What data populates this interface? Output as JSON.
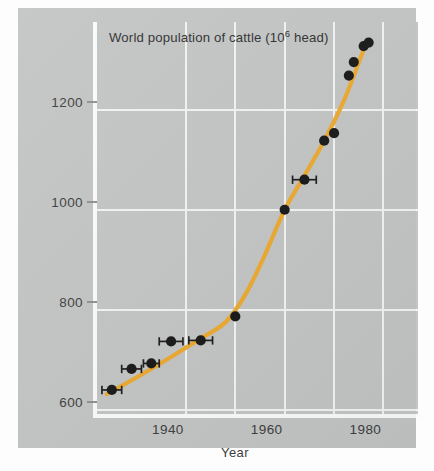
{
  "chart_data": {
    "type": "scatter",
    "title_main": "World population of cattle (10",
    "title_exp": "6",
    "title_tail": " head)",
    "xlabel": "Year",
    "ylabel": "",
    "xlim": [
      1922,
      1987
    ],
    "ylim": [
      592,
      1375
    ],
    "grid": true,
    "legend": null,
    "accent_color": "#eca92f",
    "point_color": "#171717",
    "background_color": "#c3c5c5",
    "gridline_color": "#f2f3f3",
    "yticks": [
      600,
      800,
      1000,
      1200
    ],
    "ytick_labels": [
      "600",
      "800",
      "1000",
      "1200"
    ],
    "xticks": [
      1940,
      1960,
      1980
    ],
    "xtick_labels": [
      "1940",
      "1960",
      "1980"
    ],
    "xgridlines": [
      1940,
      1950,
      1960,
      1970,
      1980
    ],
    "series": [
      {
        "name": "Observed cattle population",
        "marker": "filled-circle",
        "points": [
          {
            "x": 1925,
            "y": 640,
            "xerr": 2.0
          },
          {
            "x": 1929,
            "y": 682,
            "xerr": 2.0
          },
          {
            "x": 1933,
            "y": 693,
            "xerr": 1.6
          },
          {
            "x": 1937,
            "y": 737,
            "xerr": 2.4
          },
          {
            "x": 1943,
            "y": 739,
            "xerr": 2.4
          },
          {
            "x": 1950,
            "y": 787,
            "xerr": 0
          },
          {
            "x": 1960,
            "y": 1000,
            "xerr": 0
          },
          {
            "x": 1964,
            "y": 1060,
            "xerr": 2.4
          },
          {
            "x": 1968,
            "y": 1138,
            "xerr": 0
          },
          {
            "x": 1970,
            "y": 1153,
            "xerr": 0
          },
          {
            "x": 1973,
            "y": 1268,
            "xerr": 0
          },
          {
            "x": 1974,
            "y": 1295,
            "xerr": 0
          },
          {
            "x": 1976,
            "y": 1327,
            "xerr": 0
          },
          {
            "x": 1977,
            "y": 1334,
            "xerr": 0
          }
        ]
      },
      {
        "name": "Fitted trend curve",
        "marker": "line",
        "points": [
          {
            "x": 1924,
            "y": 632
          },
          {
            "x": 1930,
            "y": 665
          },
          {
            "x": 1936,
            "y": 700
          },
          {
            "x": 1942,
            "y": 737
          },
          {
            "x": 1948,
            "y": 775
          },
          {
            "x": 1952,
            "y": 830
          },
          {
            "x": 1956,
            "y": 910
          },
          {
            "x": 1960,
            "y": 1000
          },
          {
            "x": 1964,
            "y": 1068
          },
          {
            "x": 1968,
            "y": 1138
          },
          {
            "x": 1972,
            "y": 1218
          },
          {
            "x": 1976,
            "y": 1320
          }
        ]
      }
    ]
  }
}
